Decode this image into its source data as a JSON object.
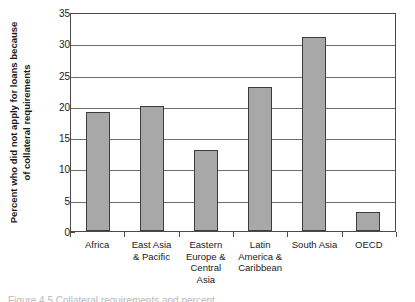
{
  "chart_data": {
    "type": "bar",
    "title": "",
    "xlabel": "",
    "ylabel": "Percent who did not apply for loans because of collateral requirements",
    "ylabel_line1": "Percent who did not apply for loans because",
    "ylabel_line2": "of collateral requirements",
    "categories": [
      "Africa",
      "East Asia & Pacific",
      "Eastern Europe & Central Asia",
      "Latin America & Caribbean",
      "South Asia",
      "OECD"
    ],
    "category_lines": [
      [
        "Africa"
      ],
      [
        "East Asia",
        "& Pacific"
      ],
      [
        "Eastern",
        "Europe &",
        "Central",
        "Asia"
      ],
      [
        "Latin",
        "America &",
        "Caribbean"
      ],
      [
        "South Asia"
      ],
      [
        "OECD"
      ]
    ],
    "values": [
      19,
      20,
      13,
      23,
      31,
      3
    ],
    "ylim": [
      0,
      35
    ],
    "yticks": [
      0,
      5,
      10,
      15,
      20,
      25,
      30,
      35
    ],
    "ytick_labels": [
      "0",
      "5",
      "10",
      "15",
      "20",
      "25",
      "30",
      "35"
    ],
    "grid": true,
    "legend": false,
    "bar_color": "#a8a8a8",
    "bar_edge_color": "#3d3d3d",
    "gridline_color": "#6e6e6e",
    "axis_color": "#4a4a4a"
  },
  "caption": {
    "text": "Figure 4.5   Collateral requirements and percent"
  }
}
